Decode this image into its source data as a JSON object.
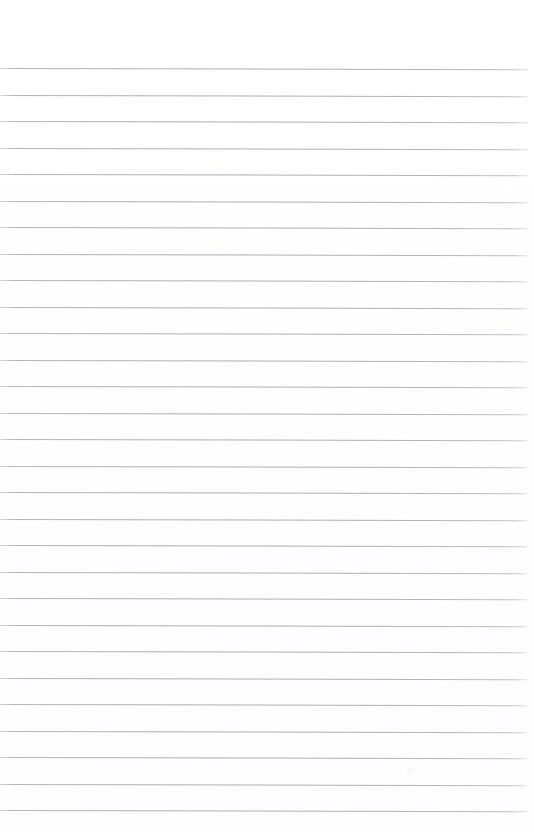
{
  "document": {
    "type": "scanned-lined-paper",
    "title": "",
    "body_text": "",
    "page_number": "",
    "header_text": "",
    "footer_text": "",
    "is_blank": true
  },
  "page": {
    "width": 534,
    "height": 832,
    "background_color": "#fefefe",
    "paper_color": "#ffffff"
  },
  "ruling": {
    "line_color": "#aeb2b8",
    "line_thickness_px": 1,
    "line_count": 29,
    "first_line_y": 68,
    "line_spacing_px": 26.5,
    "left_margin_px": 0,
    "right_margin_px": 6,
    "line_start_x": 0,
    "line_end_x": 528,
    "top_margin_px": 68,
    "bottom_margin_px": 22,
    "skew_degrees": 0.13,
    "line_y_positions": [
      68,
      94.5,
      121,
      147.5,
      174,
      200.5,
      227,
      253.5,
      280,
      306.5,
      333,
      359.5,
      386,
      412.5,
      439,
      465.5,
      492,
      518.5,
      545,
      571.5,
      598,
      624.5,
      651,
      677.5,
      704,
      730.5,
      757,
      783.5,
      810
    ]
  },
  "artifacts": [
    {
      "name": "scanner-smudge",
      "x": 406,
      "y": 767,
      "opacity": 0.4
    }
  ]
}
